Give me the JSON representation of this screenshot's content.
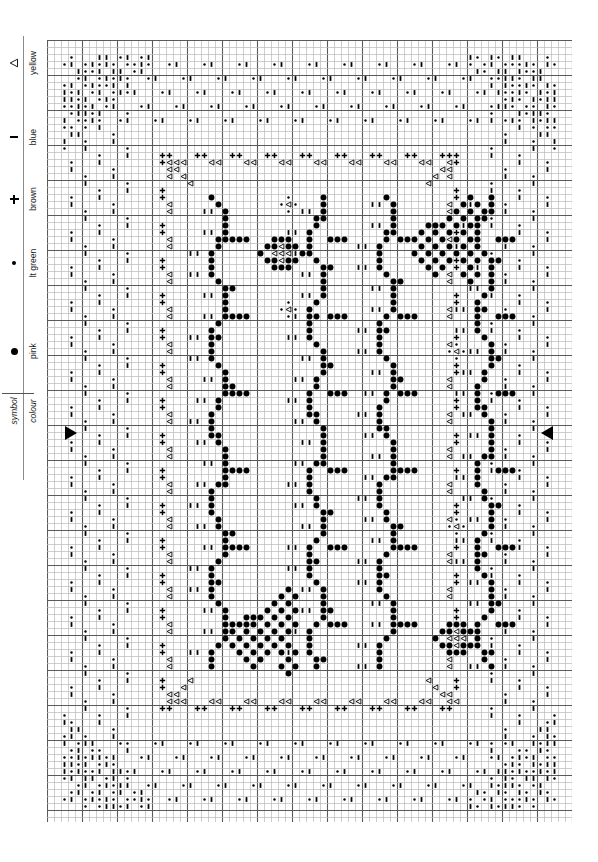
{
  "document": {
    "kind": "cross-stitch-chart",
    "width": 598,
    "height": 862
  },
  "legend": {
    "header": {
      "symbol_label": "symbol",
      "colour_label": "colour"
    },
    "entries": [
      {
        "symbol": "large-filled-circle",
        "colour": "pink",
        "glyph": "●"
      },
      {
        "symbol": "small-filled-circle",
        "colour": "lt green",
        "glyph": "•"
      },
      {
        "symbol": "plus-sign",
        "colour": "brown",
        "glyph": "+"
      },
      {
        "symbol": "short-dash",
        "colour": "blue",
        "glyph": "–"
      },
      {
        "symbol": "hollow-triangle",
        "colour": "yellow",
        "glyph": "◁"
      }
    ]
  },
  "chart": {
    "columns": 75,
    "rows": 112,
    "cell_size": 7,
    "bold_every": 5,
    "grid_colour": "#b9b9b9",
    "bold_grid_colour": "#5a5a5a",
    "symbol_colour": "#000000",
    "centre_markers": {
      "left_arrow": "centre-row-marker-left",
      "right_arrow": "centre-row-marker-right",
      "centre_row": 56
    }
  },
  "chart_data": {
    "type": "heatmap",
    "title": "",
    "xlabel": "",
    "ylabel": "",
    "grid": true,
    "legend_position": "left",
    "symbol_key": {
      "P": "pink",
      "G": "lt green",
      "B": "brown",
      "L": "blue",
      "Y": "yellow"
    },
    "motifs": [
      {
        "name": "corner-diagonal-fill",
        "symbols": [
          "blue",
          "lt green"
        ],
        "count": 4
      },
      {
        "name": "scalloped-border",
        "symbols": [
          "brown",
          "yellow"
        ],
        "count": 1
      },
      {
        "name": "vertical-vine-stripe",
        "symbols": [
          "pink",
          "blue"
        ],
        "count": 4
      },
      {
        "name": "small-flower",
        "symbols": [
          "pink",
          "yellow"
        ],
        "count": 2
      },
      {
        "name": "large-butterfly-floral",
        "symbols": [
          "pink"
        ],
        "count": 2
      },
      {
        "name": "tiny-bud",
        "symbols": [
          "lt green",
          "yellow"
        ],
        "count": 4
      }
    ]
  }
}
